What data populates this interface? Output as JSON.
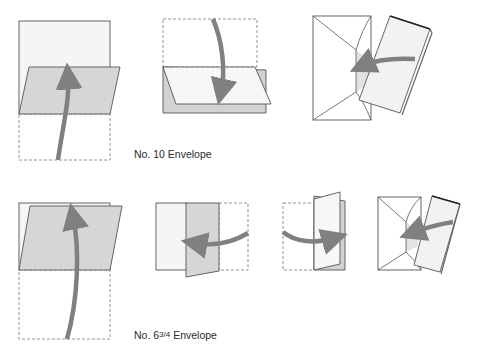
{
  "figure": {
    "colors": {
      "outline": "#555555",
      "dashed": "#777777",
      "paper": "#f4f4f4",
      "shaded": "#d6d6d6",
      "arrow": "#808080"
    },
    "rows": [
      {
        "caption": "No. 10 Envelope",
        "steps": [
          {
            "step": 1,
            "description": "Fold bottom third up",
            "arrow": "up"
          },
          {
            "step": 2,
            "description": "Fold top third down",
            "arrow": "down"
          },
          {
            "step": 3,
            "description": "Insert folded letter into envelope",
            "arrow": "left"
          }
        ]
      },
      {
        "caption_prefix": "No. 6",
        "caption_fraction": "3/4",
        "caption_suffix": "Envelope",
        "steps": [
          {
            "step": 1,
            "description": "Fold bottom half up",
            "arrow": "up"
          },
          {
            "step": 2,
            "description": "Fold right third to the left",
            "arrow": "left"
          },
          {
            "step": 3,
            "description": "Fold left third to the right",
            "arrow": "right"
          },
          {
            "step": 4,
            "description": "Insert folded letter into envelope",
            "arrow": "left"
          }
        ]
      }
    ]
  }
}
